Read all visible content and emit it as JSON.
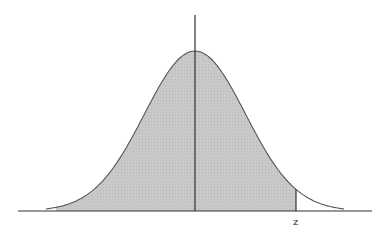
{
  "chart_data": {
    "type": "area",
    "title": "",
    "xlabel": "",
    "ylabel": "",
    "annotations": [
      {
        "text": "z",
        "x": 2.0,
        "position": "below axis"
      }
    ],
    "distribution": {
      "name": "normal",
      "mean": 0,
      "sd": 1
    },
    "shaded_region": {
      "from": -2.75,
      "to": 2.0,
      "description": "area under curve left of z"
    },
    "x_range": [
      -3,
      3
    ],
    "grid": false,
    "legend": null,
    "colors": {
      "fill": "#c9c9c9",
      "curve": "#555555",
      "axis": "#333333"
    }
  },
  "labels": {
    "z": "z"
  }
}
